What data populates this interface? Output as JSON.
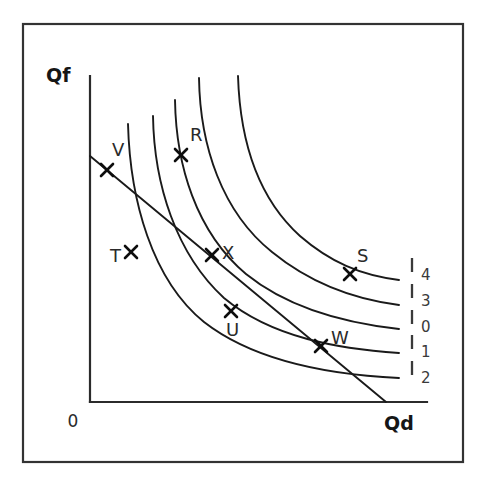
{
  "figure": {
    "kind": "indifference-curve-budget-line-diagram",
    "background_color": "#ffffff",
    "ink_color": "#1a1a1a",
    "frame": {
      "x": 23,
      "y": 24,
      "width": 440,
      "height": 438
    }
  },
  "axes": {
    "y_axis_title": "Qf",
    "x_axis_title": "Qd",
    "origin_label": "0",
    "origin": {
      "x": 90,
      "y": 402
    },
    "y_axis_top": {
      "x": 90,
      "y": 76
    },
    "x_axis_right": {
      "x": 427,
      "y": 402
    }
  },
  "chart_data": {
    "type": "line",
    "title": "",
    "xlabel": "Qd",
    "ylabel": "Qf",
    "grid": false,
    "legend_position": "right",
    "xlim": [
      0,
      100
    ],
    "ylim": [
      0,
      100
    ],
    "curves": [
      {
        "name": "4",
        "legend_label": "4",
        "rank": "highest",
        "top_point": {
          "x": 238,
          "y": 76
        },
        "right_point": {
          "x": 399,
          "y": 280
        },
        "path": "M 238 76 C 240 140, 258 198, 300 236 C 330 262, 360 275, 399 280"
      },
      {
        "name": "3",
        "legend_label": "3",
        "rank": "second",
        "top_point": {
          "x": 199,
          "y": 78
        },
        "right_point": {
          "x": 399,
          "y": 305
        },
        "path": "M 199 78 C 200 146, 222 212, 272 252 C 310 283, 352 299, 399 305"
      },
      {
        "name": "0",
        "legend_label": "0",
        "rank": "middle",
        "top_point": {
          "x": 175,
          "y": 100
        },
        "right_point": {
          "x": 399,
          "y": 329
        },
        "path": "M 175 100 C 176 165, 196 232, 246 274 C 288 308, 345 323, 399 329"
      },
      {
        "name": "1",
        "legend_label": "1",
        "rank": "fourth",
        "top_point": {
          "x": 153,
          "y": 116
        },
        "right_point": {
          "x": 399,
          "y": 353
        },
        "path": "M 153 116 C 154 184, 176 254, 224 298 C 272 338, 340 349, 399 353"
      },
      {
        "name": "2",
        "legend_label": "2",
        "rank": "lowest",
        "top_point": {
          "x": 128,
          "y": 124
        },
        "right_point": {
          "x": 399,
          "y": 378
        },
        "path": "M 128 124 C 130 200, 152 280, 204 322 C 258 364, 336 375, 399 378"
      }
    ],
    "budget_line": {
      "name": "budget-line",
      "start": {
        "x": 90,
        "y": 156
      },
      "end": {
        "x": 386,
        "y": 402
      }
    },
    "points": [
      {
        "label": "V",
        "x": 107,
        "y": 170,
        "label_x": 112,
        "label_y": 156,
        "on": "budget-line"
      },
      {
        "label": "R",
        "x": 181,
        "y": 155,
        "label_x": 190,
        "label_y": 141,
        "on": "curve-4"
      },
      {
        "label": "T",
        "x": 131,
        "y": 252,
        "label_x": 110,
        "label_y": 262,
        "on": "curve-2"
      },
      {
        "label": "X",
        "x": 212,
        "y": 255,
        "label_x": 222,
        "label_y": 259,
        "on": "curve-3"
      },
      {
        "label": "S",
        "x": 350,
        "y": 274,
        "label_x": 357,
        "label_y": 262,
        "on": "curve-4"
      },
      {
        "label": "U",
        "x": 231,
        "y": 311,
        "label_x": 226,
        "label_y": 336,
        "on": "curve-1"
      },
      {
        "label": "W",
        "x": 321,
        "y": 346,
        "label_x": 331,
        "label_y": 344,
        "on": "curve-1"
      }
    ],
    "legend_entries": [
      {
        "label": "4",
        "tick_x": 412,
        "tick_y1": 258,
        "tick_y2": 272,
        "label_x": 421,
        "label_y": 280
      },
      {
        "label": "3",
        "tick_x": 412,
        "tick_y1": 284,
        "tick_y2": 298,
        "label_x": 421,
        "label_y": 306
      },
      {
        "label": "0",
        "tick_x": 412,
        "tick_y1": 310,
        "tick_y2": 324,
        "label_x": 421,
        "label_y": 332
      },
      {
        "label": "1",
        "tick_x": 412,
        "tick_y1": 335,
        "tick_y2": 349,
        "label_x": 421,
        "label_y": 357
      },
      {
        "label": "2",
        "tick_x": 412,
        "tick_y1": 361,
        "tick_y2": 375,
        "label_x": 421,
        "label_y": 383
      }
    ]
  }
}
